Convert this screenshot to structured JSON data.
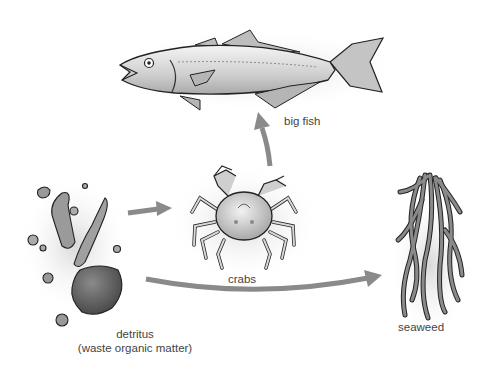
{
  "diagram": {
    "type": "food-web",
    "nodes": [
      {
        "id": "big_fish",
        "label": "big fish"
      },
      {
        "id": "crabs",
        "label": "crabs"
      },
      {
        "id": "seaweed",
        "label": "seaweed"
      },
      {
        "id": "detritus",
        "label": "detritus",
        "sublabel": "(waste organic matter)"
      }
    ],
    "edges": [
      {
        "from": "detritus",
        "to": "crabs"
      },
      {
        "from": "crabs",
        "to": "big_fish"
      },
      {
        "from": "detritus",
        "to": "seaweed"
      }
    ],
    "colors": {
      "arrow": "#8a8a8a",
      "outline": "#222222",
      "label": "#444444"
    }
  }
}
